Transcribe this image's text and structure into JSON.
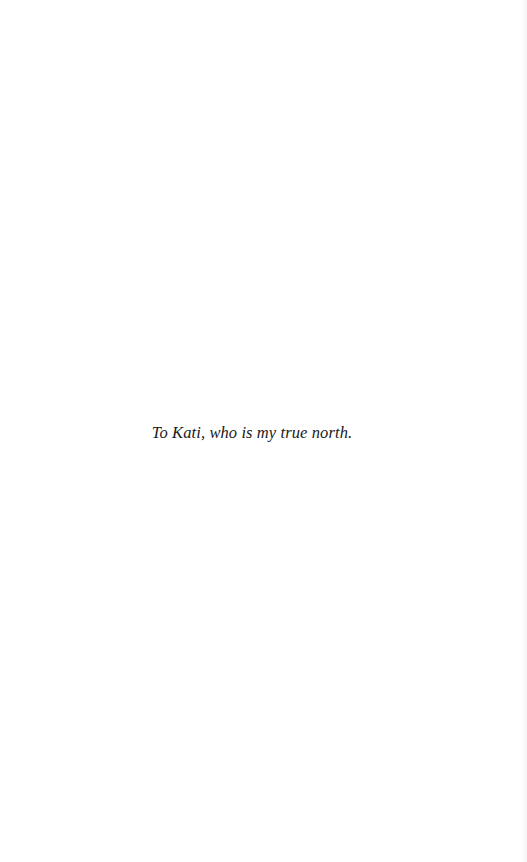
{
  "page": {
    "type": "dedication",
    "dedication_text": "To Kati, who is my true north."
  }
}
